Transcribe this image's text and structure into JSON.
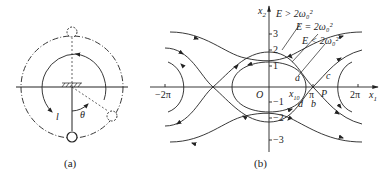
{
  "panel_a": {
    "caption": "(a)",
    "length_label": "l",
    "angle_label": "θ"
  },
  "panel_b": {
    "caption": "(b)",
    "axis_x_label": "x",
    "axis_x_sub": "1",
    "axis_y_label": "x",
    "axis_y_sub": "2",
    "origin_label": "O",
    "x_ticks": [
      "−2π",
      "π",
      "2π"
    ],
    "y_ticks": [
      "3",
      "2",
      "1",
      "−1",
      "−2",
      "−3"
    ],
    "energy_labels": [
      "E > 2ω₀²",
      "E = 2ω₀²",
      "E < 2ω₀²"
    ],
    "point_labels": {
      "a": "a",
      "b": "b",
      "c": "c",
      "d": "d",
      "P": "P",
      "x10": "x",
      "x10_sub": "10"
    }
  }
}
